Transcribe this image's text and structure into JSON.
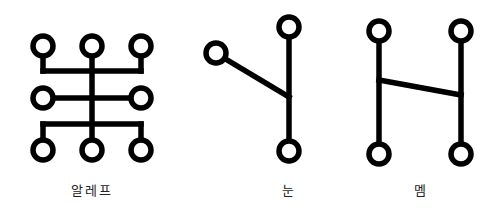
{
  "figures": [
    {
      "id": "aleph",
      "label": "알레프"
    },
    {
      "id": "nun",
      "label": "눈"
    },
    {
      "id": "mem",
      "label": "멤"
    }
  ],
  "colors": {
    "stroke": "#000000",
    "background": "#ffffff"
  }
}
